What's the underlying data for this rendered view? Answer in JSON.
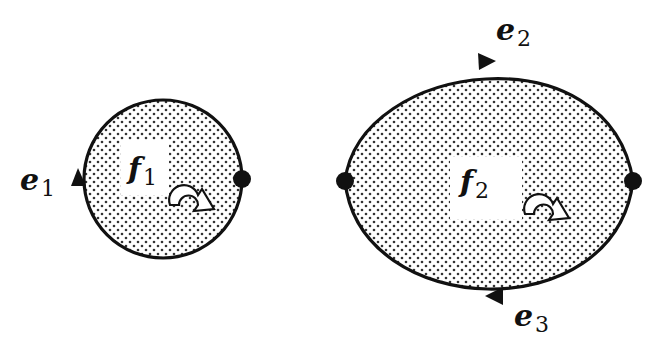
{
  "diagram": {
    "type": "planar-graph-faces",
    "colors": {
      "stroke": "#111111",
      "fill_dots": "#333333",
      "background": "#ffffff"
    },
    "faces": [
      {
        "id": "f1",
        "label_main": "f",
        "label_sub": "1",
        "boundary_edges": [
          "e1"
        ],
        "orientation": "clockwise"
      },
      {
        "id": "f2",
        "label_main": "f",
        "label_sub": "2",
        "boundary_edges": [
          "e2",
          "e3"
        ],
        "orientation": "clockwise"
      }
    ],
    "edges": [
      {
        "id": "e1",
        "label_main": "e",
        "label_sub": "1",
        "direction": "up (loop)"
      },
      {
        "id": "e2",
        "label_main": "e",
        "label_sub": "2",
        "direction": "right"
      },
      {
        "id": "e3",
        "label_main": "e",
        "label_sub": "3",
        "direction": "left"
      }
    ],
    "vertices": [
      {
        "id": "v1",
        "on": "f1-right"
      },
      {
        "id": "v2",
        "on": "f2-left"
      },
      {
        "id": "v3",
        "on": "f2-right"
      }
    ]
  }
}
